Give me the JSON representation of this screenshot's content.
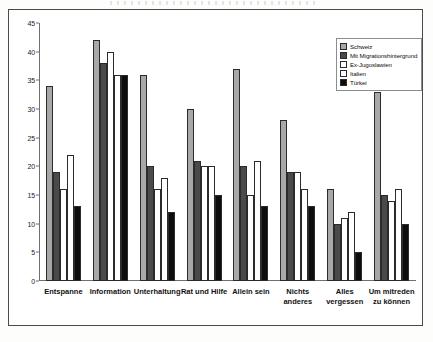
{
  "chart_data": {
    "type": "bar",
    "title": "",
    "subtitle": "",
    "xlabel": "",
    "ylabel": "",
    "ylim": [
      0,
      45
    ],
    "ytick_step": 5,
    "yticks": [
      "0",
      "5",
      "10",
      "15",
      "20",
      "25",
      "30",
      "35",
      "40",
      "45"
    ],
    "grid": false,
    "legend_position": "top-right",
    "categories": [
      "Entspanne",
      "Information",
      "Unterhaltung",
      "Rat und Hilfe",
      "Allein sein",
      "Nichts anderes",
      "Alles vergessen",
      "Um mitreden zu können"
    ],
    "category_lines": [
      [
        "Entspanne"
      ],
      [
        "Information"
      ],
      [
        "Unterhaltung"
      ],
      [
        "Rat und Hilfe"
      ],
      [
        "Allein sein"
      ],
      [
        "Nichts",
        "anderes"
      ],
      [
        "Alles",
        "vergessen"
      ],
      [
        "Um mitreden",
        "zu können"
      ]
    ],
    "series": [
      {
        "name": "Schweiz",
        "color": "#a8a8a8",
        "values": [
          34,
          42,
          36,
          30,
          37,
          28,
          16,
          33
        ]
      },
      {
        "name": "Mit Migrationshintergrund",
        "color": "#4a4a4a",
        "values": [
          19,
          38,
          20,
          21,
          20,
          19,
          10,
          15
        ]
      },
      {
        "name": "Ex-Jugoslawien",
        "color": "#ffffff",
        "values": [
          16,
          40,
          16,
          20,
          15,
          19,
          11,
          14
        ]
      },
      {
        "name": "Italien",
        "color": "#ffffff",
        "values": [
          22,
          36,
          18,
          20,
          21,
          16,
          12,
          16
        ]
      },
      {
        "name": "Türkei",
        "color": "#0d0d0d",
        "values": [
          13,
          36,
          12,
          15,
          13,
          13,
          5,
          10
        ]
      }
    ]
  }
}
